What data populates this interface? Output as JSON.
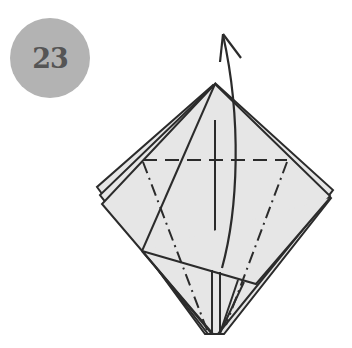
{
  "step": {
    "number": "23"
  },
  "colors": {
    "badge": "#b3b3b3",
    "badge_text": "#555555",
    "paper": "#e6e6e6",
    "line": "#2b2b2b"
  },
  "diagram": {
    "fold_lines": [
      "valley-fold-horizontal",
      "mountain-fold-left",
      "mountain-fold-right"
    ],
    "arrows": [
      "lift-up-arrow"
    ]
  }
}
